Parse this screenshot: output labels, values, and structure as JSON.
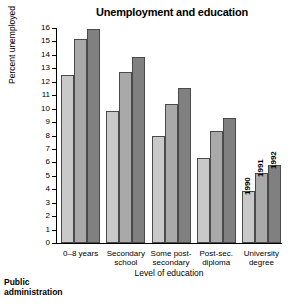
{
  "footer": {
    "text": "Public\nadministration"
  },
  "chart_data": {
    "type": "bar",
    "title": "Unemployment and education",
    "xlabel": "Level of education",
    "ylabel": "Percent unemployed",
    "ylim": [
      0,
      16
    ],
    "ytick_step": 1,
    "yticks": [
      "0",
      "1",
      "2",
      "3",
      "4",
      "5",
      "6",
      "7",
      "8",
      "9",
      "10",
      "11",
      "12",
      "13",
      "14",
      "15",
      "16"
    ],
    "grid": false,
    "legend_position": "in-plot-rotated-over-last-group",
    "categories": [
      "0–8 years",
      "Secondary school",
      "Some post-secondary",
      "Post-sec. diploma",
      "University degree"
    ],
    "category_lines": [
      [
        "0–8 years"
      ],
      [
        "Secondary",
        "school"
      ],
      [
        "Some post-",
        "secondary"
      ],
      [
        "Post-sec.",
        "diploma"
      ],
      [
        "University",
        "degree"
      ]
    ],
    "series": [
      {
        "name": "1990",
        "color": "#c9c9c9",
        "values": [
          12.5,
          9.8,
          8.0,
          6.35,
          3.9
        ]
      },
      {
        "name": "1991",
        "color": "#a9a9a9",
        "values": [
          15.2,
          12.75,
          10.35,
          8.3,
          5.2
        ]
      },
      {
        "name": "1992",
        "color": "#808080",
        "values": [
          15.95,
          13.85,
          11.55,
          9.3,
          5.8
        ]
      }
    ],
    "annotations": [
      {
        "text": "1990",
        "series": "1990",
        "group": "University degree"
      },
      {
        "text": "1991",
        "series": "1991",
        "group": "University degree"
      },
      {
        "text": "1992",
        "series": "1992",
        "group": "University degree"
      }
    ]
  }
}
